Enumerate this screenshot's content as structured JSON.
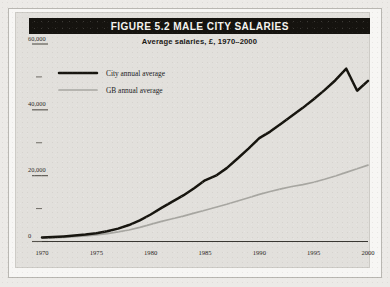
{
  "figure": {
    "title": "FIGURE 5.2  MALE CITY SALARIES",
    "subtitle": "Average salaries, £, 1970–2000"
  },
  "colors": {
    "title_bar_bg": "#15130f",
    "title_bar_text": "#f4f3f0",
    "panel_bg": "#e2e0dc",
    "page_bg": "#f7f6f4",
    "city_line": "#17150f",
    "gb_line": "#a7a6a1",
    "axis": "#3a3833"
  },
  "chart_data": {
    "type": "line",
    "title": "FIGURE 5.2  MALE CITY SALARIES",
    "subtitle": "Average salaries, £, 1970–2000",
    "xlabel": "",
    "ylabel": "",
    "xlim": [
      1970,
      2000
    ],
    "ylim": [
      0,
      60000
    ],
    "grid": false,
    "legend_position": "top-left",
    "xticks": [
      1970,
      1975,
      1980,
      1985,
      1990,
      1995,
      2000
    ],
    "xtick_labels": [
      "1970",
      "1975",
      "1980",
      "1985",
      "1990",
      "1995",
      "2000"
    ],
    "yticks": [
      0,
      10000,
      20000,
      30000,
      40000,
      50000,
      60000
    ],
    "ytick_labels": [
      "0",
      "",
      "20,000",
      "",
      "40,000",
      "",
      "60,000"
    ],
    "x": [
      1970,
      1971,
      1972,
      1973,
      1974,
      1975,
      1976,
      1977,
      1978,
      1979,
      1980,
      1981,
      1982,
      1983,
      1984,
      1985,
      1986,
      1987,
      1988,
      1989,
      1990,
      1991,
      1992,
      1993,
      1994,
      1995,
      1996,
      1997,
      1998,
      1999,
      2000
    ],
    "series": [
      {
        "name": "City annual average",
        "color": "#17150f",
        "values": [
          1200,
          1350,
          1550,
          1800,
          2100,
          2500,
          3100,
          3900,
          5000,
          6400,
          8200,
          10200,
          12100,
          14000,
          16200,
          18600,
          20000,
          22300,
          25200,
          28200,
          31400,
          33400,
          35800,
          38200,
          40600,
          43200,
          46000,
          49000,
          52500,
          45800,
          48800
        ]
      },
      {
        "name": "GB annual average",
        "color": "#a7a6a1",
        "values": [
          1000,
          1100,
          1250,
          1450,
          1700,
          2000,
          2400,
          2900,
          3500,
          4300,
          5200,
          6100,
          6900,
          7700,
          8600,
          9500,
          10400,
          11300,
          12300,
          13300,
          14300,
          15200,
          16000,
          16700,
          17300,
          18000,
          18900,
          19900,
          21000,
          22100,
          23200
        ]
      }
    ]
  },
  "legend": {
    "items": [
      {
        "label": "City annual average",
        "color": "#17150f",
        "style": "thick"
      },
      {
        "label": "GB annual average",
        "color": "#a7a6a1",
        "style": "thin"
      }
    ]
  }
}
